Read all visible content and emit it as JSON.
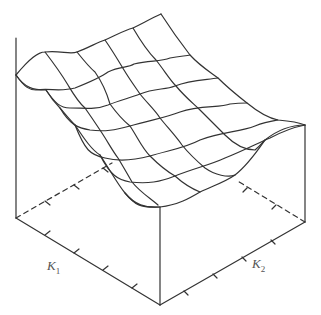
{
  "figure": {
    "type": "3d-wireframe-surface",
    "axes": {
      "x_label": "K",
      "x_label_sub": "1",
      "y_label": "K",
      "y_label_sub": "2",
      "x_ticks": 4,
      "y_ticks": 4,
      "z_label": ""
    },
    "colors": {
      "line": "#333333",
      "background": "#ffffff",
      "label": "#555555"
    },
    "grid": {
      "rows": 7,
      "cols": 7
    }
  }
}
